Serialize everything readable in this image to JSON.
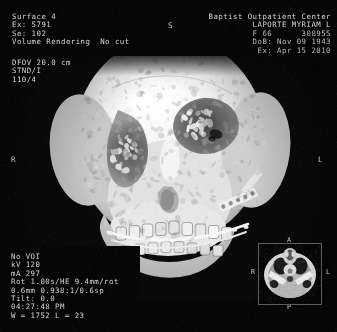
{
  "viewer": {
    "modality": "CT 3D Volume Rendering",
    "background_color": "#0a0a0a",
    "text_color": "#d8d8d8"
  },
  "header_left": {
    "surface": "Surface 4",
    "exam": "Ex: 5791",
    "series": "Se: 102",
    "mode": "Volume Rendering  No cut"
  },
  "header_right": {
    "institution": "Baptist Outpatient Center",
    "patient_name": "LAPORTE MYRIAM L",
    "sex_age_id": "F 66      308955",
    "dob": "DoB: Nov 09 1943",
    "exam_date": "Ex: Apr 15 2010"
  },
  "technique_left": {
    "dfov": "DFOV 20.0 cm",
    "algorithm": "STND/I",
    "window_preset": "110/4"
  },
  "acquisition": {
    "voi": "No VOI",
    "kv": "kV 120",
    "ma": "mA 297",
    "rotation": "Rot 1.00s/HE 9.4mm/rot",
    "slice": "0.6mm 0.938:1/0.6sp",
    "tilt": "Tilt: 0.0",
    "time": "04:27:48 PM",
    "window_level": "W = 1752 L = 23"
  },
  "orientation_markers": {
    "superior": "S",
    "right": "R",
    "left": "L"
  },
  "thumbnail": {
    "label_anterior": "A",
    "label_posterior": "P",
    "label_left": "L",
    "label_right": "R"
  }
}
